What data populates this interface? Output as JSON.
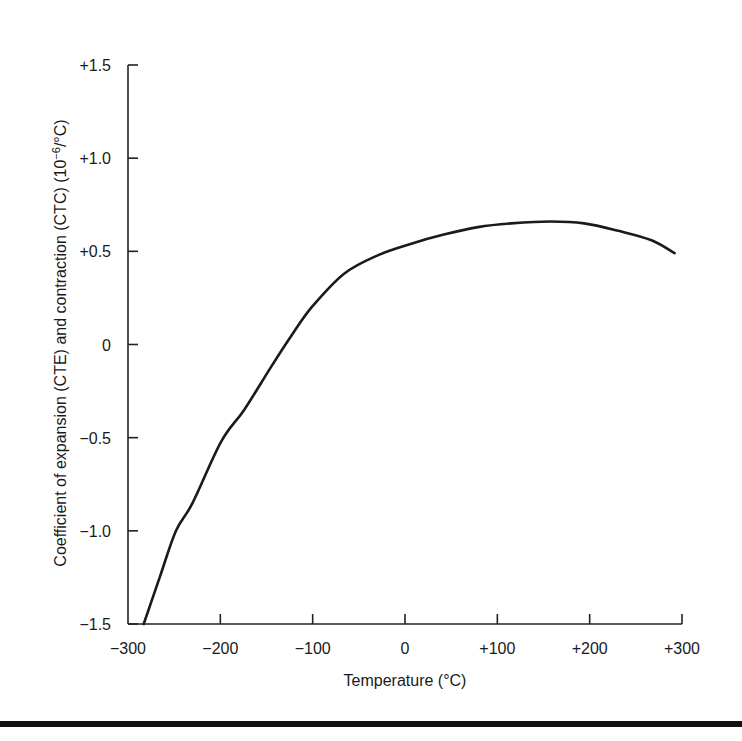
{
  "chart_data": {
    "type": "line",
    "title": "",
    "xlabel": "Temperature (°C)",
    "ylabel": "Coefficient of expansion (CTE) and contraction (CTC) (10⁻⁶/°C)",
    "xlim": [
      -300,
      300
    ],
    "ylim": [
      -1.5,
      1.5
    ],
    "xticks": [
      -300,
      -200,
      -100,
      0,
      100,
      200,
      300
    ],
    "xtick_labels": [
      "−300",
      "−200",
      "−100",
      "0",
      "+100",
      "+200",
      "+300"
    ],
    "yticks": [
      -1.5,
      -1.0,
      -0.5,
      0,
      0.5,
      1.0,
      1.5
    ],
    "ytick_labels": [
      "−1.5",
      "−1.0",
      "−0.5",
      "0",
      "+0.5",
      "+1.0",
      "+1.5"
    ],
    "grid": false,
    "legend": null,
    "series": [
      {
        "name": "CTE/CTC",
        "x": [
          -283,
          -265,
          -248,
          -230,
          -199,
          -174,
          -145,
          -124,
          -101,
          -66,
          -29,
          6,
          42,
          79,
          115,
          158,
          194,
          231,
          267,
          292
        ],
        "y": [
          -1.5,
          -1.24,
          -1.0,
          -0.85,
          -0.52,
          -0.35,
          -0.12,
          0.04,
          0.2,
          0.38,
          0.48,
          0.54,
          0.59,
          0.63,
          0.65,
          0.66,
          0.65,
          0.61,
          0.56,
          0.49
        ]
      }
    ]
  }
}
